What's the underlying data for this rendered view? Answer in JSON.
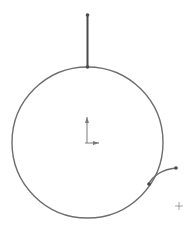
{
  "sketch": {
    "colors": {
      "background": "#ffffff",
      "geometry": "#6e6e6e",
      "line_dark": "#4a4a4a",
      "origin": "#7a7a7a",
      "cursor": "#8a8a8a"
    },
    "entities": {
      "circle": {
        "cx": 87.5,
        "cy": 142.5,
        "r": 75.5
      },
      "vertical_line": {
        "x1": 87.5,
        "y1": 15,
        "x2": 87.5,
        "y2": 67
      },
      "arc": {
        "start": [
          148,
          185
        ],
        "control": [
          156,
          170
        ],
        "end": [
          176,
          168
        ]
      },
      "points": [
        {
          "name": "line-top-endpoint",
          "x": 87.5,
          "y": 15
        },
        {
          "name": "line-circle-junction",
          "x": 87.5,
          "y": 67
        },
        {
          "name": "arc-start-point",
          "x": 149,
          "y": 184
        },
        {
          "name": "arc-end-point",
          "x": 176,
          "y": 168
        }
      ],
      "origin": {
        "x": 87,
        "y": 143,
        "arm_length_up": 26,
        "arm_length_right": 12
      },
      "cursor": {
        "x": 179,
        "y": 206,
        "size": 4,
        "icon": "crosshair-cursor-icon"
      }
    }
  }
}
